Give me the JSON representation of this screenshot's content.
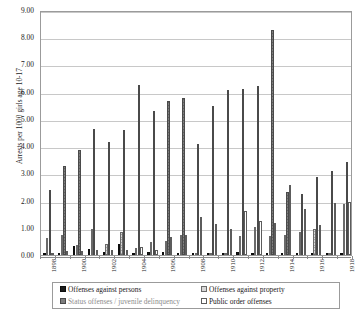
{
  "chart_data": {
    "type": "bar",
    "title": "",
    "subtitle": "",
    "xlabel": "",
    "ylabel": "Arrests per 1000 girls age 10-17",
    "ylim": [
      0.0,
      9.0
    ],
    "ytick_step": 1.0,
    "ytick_labels": [
      "0.00",
      "1.00",
      "2.00",
      "3.00",
      "4.00",
      "5.00",
      "6.00",
      "7.00",
      "8.00",
      "9.00"
    ],
    "grid": true,
    "legend_position": "bottom",
    "categories": [
      "1898",
      "1899",
      "1900",
      "1901",
      "1902",
      "1903",
      "1904",
      "1905",
      "1906",
      "1907",
      "1908",
      "1909",
      "1910",
      "1911",
      "1912",
      "1913",
      "1914",
      "1915",
      "1916",
      "1917",
      "1918"
    ],
    "xtick_labels_shown": [
      "1898",
      "",
      "1900",
      "",
      "1902",
      "",
      "1904",
      "",
      "1906",
      "",
      "1908",
      "",
      "1910",
      "",
      "1912",
      "",
      "1914",
      "",
      "1916",
      "",
      "1918"
    ],
    "series": [
      {
        "name": "Offenses against persons",
        "color": "#1c1c1c",
        "values": [
          0.08,
          0.05,
          0.33,
          0.21,
          0.1,
          0.4,
          0.02,
          0.12,
          0.1,
          0.06,
          0.0,
          0.0,
          0.0,
          0.12,
          0.02,
          0.0,
          0.0,
          0.0,
          0.0,
          0.0,
          0.0
        ]
      },
      {
        "name": "Offenses against property",
        "color": "#d8d8d8",
        "values": [
          0.62,
          0.75,
          0.36,
          0.95,
          0.42,
          0.86,
          0.27,
          0.49,
          0.5,
          0.75,
          0.0,
          0.0,
          0.0,
          0.69,
          1.03,
          0.69,
          0.72,
          0.85,
          0.97,
          0.0,
          1.87
        ]
      },
      {
        "name": "Status offenses / juvenile delinquency",
        "color": "#7d7d7d",
        "values": [
          2.38,
          3.27,
          3.85,
          4.64,
          4.15,
          4.6,
          6.25,
          5.3,
          5.64,
          5.78,
          4.09,
          5.48,
          6.07,
          6.1,
          6.22,
          8.26,
          2.32,
          2.23,
          2.85,
          3.09,
          3.41
        ]
      },
      {
        "name": "Public order offenses",
        "color": "#ffffff",
        "values": [
          0.06,
          0.13,
          0.14,
          0.18,
          0.2,
          0.17,
          0.28,
          0.19,
          0.67,
          0.75,
          1.39,
          1.15,
          0.97,
          1.63,
          1.26,
          1.18,
          2.57,
          1.68,
          1.1,
          1.92,
          1.95
        ]
      }
    ]
  },
  "legend": {
    "items": [
      {
        "label": "Offenses against persons"
      },
      {
        "label": "Offenses against property"
      },
      {
        "label": "Status offenses / juvenile delinquency"
      },
      {
        "label": "Public order offenses"
      }
    ]
  }
}
